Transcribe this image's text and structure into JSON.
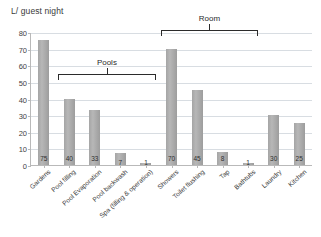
{
  "chart_data": {
    "type": "bar",
    "title": "L/ guest night",
    "xlabel": "",
    "ylabel": "L/ guest night",
    "ylim": [
      0,
      80
    ],
    "ytick_step": 10,
    "yticks": [
      "80",
      "70",
      "60",
      "50",
      "40",
      "30",
      "20",
      "10",
      "0"
    ],
    "grid": true,
    "legend": "none",
    "bar_color": "#a8a8a8",
    "categories": [
      "Gardens",
      "Pool filling",
      "Pool Evaporation",
      "Pool backwash",
      "Spa (filling & operation)",
      "Showers",
      "Toilet flushing",
      "Tap",
      "Bathtubs",
      "Laundry",
      "Kitchen"
    ],
    "values": [
      75,
      40,
      33,
      7,
      1,
      70,
      45,
      8,
      1,
      30,
      25
    ],
    "data_labels": [
      "75",
      "40",
      "33",
      "7",
      "1",
      "70",
      "45",
      "8",
      "1",
      "30",
      "25"
    ],
    "annotations": [
      {
        "label": "Pools",
        "start_index": 1,
        "end_index": 4
      },
      {
        "label": "Room",
        "start_index": 5,
        "end_index": 8
      }
    ]
  }
}
